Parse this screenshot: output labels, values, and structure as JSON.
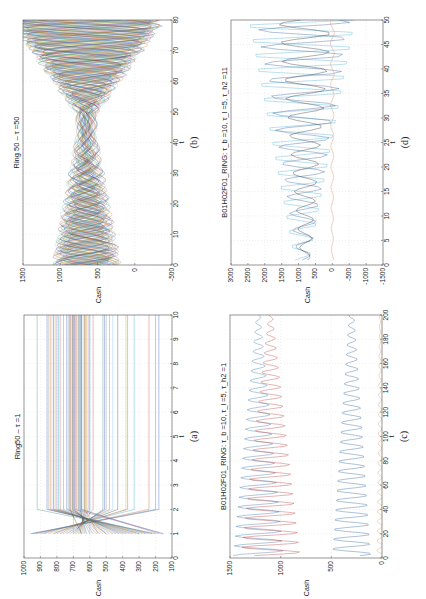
{
  "figure": {
    "orientation": "rotated-90-ccw",
    "panels": [
      "b",
      "d",
      "a",
      "c"
    ]
  },
  "chart_data": [
    {
      "id": "a",
      "type": "line",
      "caption": "(a)",
      "title": "Ring50 – τ =1",
      "xlabel": "t",
      "ylabel": "Cash",
      "xlim": [
        0,
        10
      ],
      "ylim": [
        100,
        1000
      ],
      "xticks": [
        0,
        1,
        2,
        3,
        4,
        5,
        6,
        7,
        8,
        9,
        10
      ],
      "yticks": [
        100,
        200,
        300,
        400,
        500,
        600,
        700,
        800,
        900,
        1000
      ],
      "grid": true,
      "series_count": 50,
      "description": "50 agents start at t=1 with spread values, cross between t=1 and t=2, then remain constant from t=2 to t=10",
      "final_levels": [
        180,
        200,
        240,
        330,
        370,
        380,
        430,
        460,
        480,
        500,
        510,
        520,
        580,
        600,
        610,
        620,
        630,
        640,
        650,
        655,
        660,
        670,
        680,
        690,
        695,
        700,
        705,
        710,
        720,
        730,
        740,
        760,
        780,
        790,
        800,
        810,
        820,
        830,
        840,
        850,
        860,
        920,
        650,
        660,
        690,
        700,
        720,
        600,
        630,
        670
      ],
      "start_levels_t1": [
        960,
        950,
        930,
        900,
        880,
        850,
        820,
        800,
        780,
        760,
        740,
        720,
        700,
        690,
        680,
        670,
        660,
        650,
        640,
        630,
        620,
        600,
        580,
        560,
        540,
        520,
        500,
        480,
        460,
        440,
        420,
        400,
        380,
        360,
        340,
        320,
        300,
        280,
        260,
        240,
        220,
        200,
        180,
        160,
        150,
        700,
        650,
        600,
        550,
        500
      ]
    },
    {
      "id": "b",
      "type": "line",
      "caption": "(b)",
      "title": "Ring 50 – τ =50",
      "xlabel": "t",
      "ylabel": "Cash",
      "xlim": [
        0,
        80
      ],
      "ylim": [
        -500,
        1500
      ],
      "xticks": [
        0,
        10,
        20,
        30,
        40,
        50,
        60,
        70,
        80
      ],
      "yticks": [
        -500,
        0,
        500,
        1000,
        1500
      ],
      "grid": true,
      "series_count": 50,
      "description": "Oscillating envelopes converge toward ~600-750 near t=30-50, then diverge widely after t=50 spanning roughly -400 to 1400"
    },
    {
      "id": "c",
      "type": "line",
      "caption": "(c)",
      "title": "B01H02F01_RING: τ_b =10, τ_l =5, τ_h2 =1",
      "xlabel": "t",
      "ylabel": "Cash",
      "xlim": [
        0,
        200
      ],
      "ylim": [
        0,
        1500
      ],
      "xticks": [
        0,
        20,
        40,
        60,
        80,
        100,
        120,
        140,
        160,
        180,
        200
      ],
      "yticks": [
        0,
        500,
        1000,
        1500
      ],
      "grid": true,
      "series": [
        {
          "name": "upper-1",
          "color": "#4a7fb5",
          "level": 1220,
          "amp_start": 250,
          "amp_end": 20
        },
        {
          "name": "upper-2",
          "color": "#c0504d",
          "level": 1100,
          "amp_start": 300,
          "amp_end": 20
        },
        {
          "name": "middle",
          "color": "#3f6f9f",
          "level": 300,
          "amp_start": 200,
          "amp_end": 25
        },
        {
          "name": "bottom",
          "color": "#e59866",
          "level": 20,
          "amp_start": 30,
          "amp_end": 5
        }
      ]
    },
    {
      "id": "d",
      "type": "line",
      "caption": "(d)",
      "title": "B01H02F01_RING: τ_b =10, τ_l =5, τ_h2 =11",
      "xlabel": "t",
      "ylabel": "Cash",
      "xlim": [
        0,
        50
      ],
      "ylim": [
        -1500,
        3000
      ],
      "xticks": [
        0,
        5,
        10,
        15,
        20,
        25,
        30,
        35,
        40,
        45,
        50
      ],
      "yticks": [
        -1500,
        -1000,
        -500,
        0,
        500,
        1000,
        1500,
        2000,
        2500,
        3000
      ],
      "grid": true,
      "series": [
        {
          "name": "cyan",
          "color": "#5fb8d8",
          "level": 900,
          "amp_start": 200,
          "amp_end": 1800
        },
        {
          "name": "blue",
          "color": "#4a6fa5",
          "level": 850,
          "amp_start": 150,
          "amp_end": 1400
        },
        {
          "name": "dark",
          "color": "#444444",
          "level": 800,
          "amp_start": 120,
          "amp_end": 800
        },
        {
          "name": "orange",
          "color": "#e59866",
          "level": 0,
          "amp_start": 30,
          "amp_end": 60
        }
      ]
    }
  ]
}
